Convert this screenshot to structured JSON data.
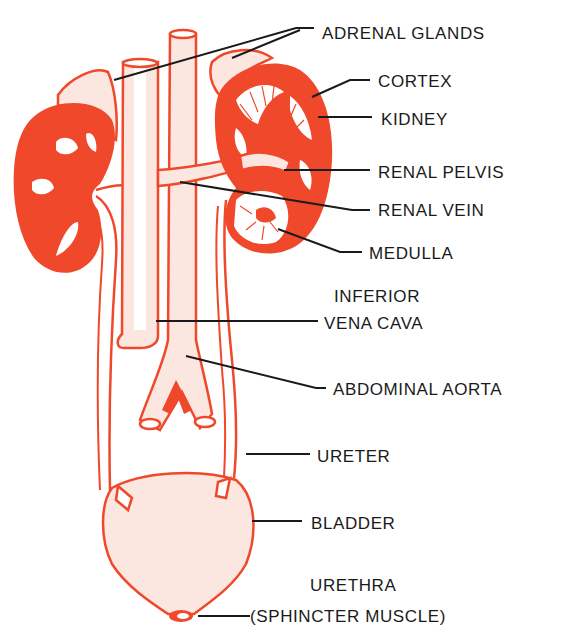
{
  "diagram": {
    "colors": {
      "organ": "#f0482a",
      "label_text": "#1a1a1a",
      "leader_line": "#1a1a1a",
      "background": "#ffffff"
    },
    "labels": {
      "adrenal_glands": "ADRENAL GLANDS",
      "cortex": "CORTEX",
      "kidney": "KIDNEY",
      "renal_pelvis": "RENAL PELVIS",
      "renal_vein": "RENAL VEIN",
      "medulla": "MEDULLA",
      "inferior_vena_cava_line1": "INFERIOR",
      "inferior_vena_cava_line2": "VENA CAVA",
      "abdominal_aorta": "ABDOMINAL AORTA",
      "ureter": "URETER",
      "bladder": "BLADDER",
      "urethra_line1": "URETHRA",
      "urethra_line2": "(SPHINCTER MUSCLE)"
    }
  }
}
